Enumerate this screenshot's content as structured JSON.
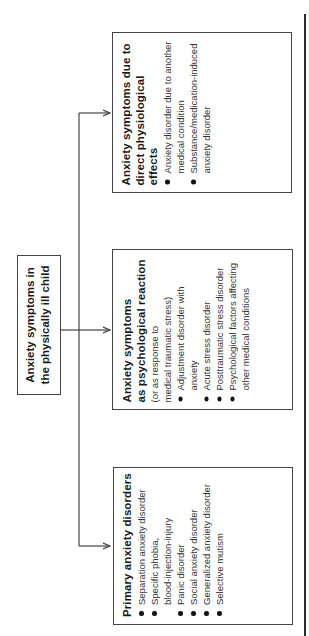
{
  "root": {
    "title_line1": "Anxiety symptoms in",
    "title_line2": "the physically ill child"
  },
  "branches": [
    {
      "title_line1": "Primary anxiety disorders",
      "items": [
        "Separation anxiety disorder",
        "Specific phobia,\nblood-injection-injury",
        "Panic disorder",
        "Social anxiety disorder",
        "Generalized anxiety disorder",
        "Selective mutism"
      ]
    },
    {
      "title_line1": "Anxiety symptoms",
      "title_line2": "as psychological reaction",
      "subtitle_line1": "(or as response to",
      "subtitle_line2": "medical traumatic stress)",
      "items": [
        "Adjustment disorder with anxiety",
        "Acute stress disorder",
        "Posttraumatic stress disorder",
        "Psychological factors affecting other medical conditions"
      ]
    },
    {
      "title_line1": "Anxiety symptoms due to",
      "title_line2": "direct physiological effects",
      "items": [
        "Anxiety disorder due to another medical condition",
        "Substance/medication-induced anxiety disorder"
      ]
    }
  ],
  "colors": {
    "line": "#444444",
    "text": "#1a1a1a",
    "background": "#ffffff"
  }
}
